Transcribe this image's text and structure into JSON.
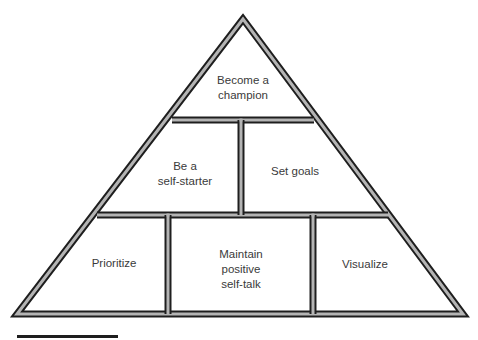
{
  "diagram": {
    "type": "pyramid",
    "tiers": [
      {
        "level": 1,
        "blocks": [
          {
            "id": "become-champion",
            "lines": [
              "Become a",
              "champion"
            ]
          }
        ]
      },
      {
        "level": 2,
        "blocks": [
          {
            "id": "self-starter",
            "lines": [
              "Be a",
              "self-starter"
            ]
          },
          {
            "id": "set-goals",
            "lines": [
              "Set goals"
            ]
          }
        ]
      },
      {
        "level": 3,
        "blocks": [
          {
            "id": "prioritize",
            "lines": [
              "Prioritize"
            ]
          },
          {
            "id": "positive-self-talk",
            "lines": [
              "Maintain",
              "positive",
              "self-talk"
            ]
          },
          {
            "id": "visualize",
            "lines": [
              "Visualize"
            ]
          }
        ]
      }
    ],
    "colors": {
      "stroke_dark": "#1e1e1e",
      "stroke_light": "#b4b4b4",
      "text": "#3a3a3a",
      "background": "#ffffff"
    }
  }
}
